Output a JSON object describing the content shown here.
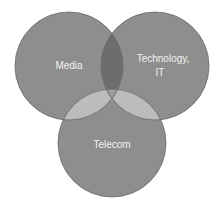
{
  "diagram": {
    "type": "venn",
    "sets": [
      {
        "id": "media",
        "label": "Media",
        "cx": 69,
        "cy": 66,
        "r": 54
      },
      {
        "id": "tech",
        "label_line1": "Technology,",
        "label_line2": "IT",
        "cx": 155,
        "cy": 66,
        "r": 54
      },
      {
        "id": "telecom",
        "label": "Telecom",
        "cx": 112,
        "cy": 143,
        "r": 54
      }
    ],
    "colors": {
      "circle_fill": "#8e8e8e",
      "circle_stroke": "#6a6a6a",
      "media_tech_overlap": "#6d6d6d",
      "telecom_overlap": "#bcbcbc",
      "center_overlap": "#9c9c9c",
      "label": "#f2f2f2"
    }
  }
}
